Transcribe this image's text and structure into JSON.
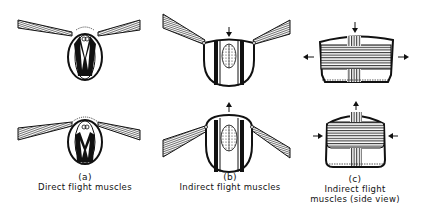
{
  "panels": [
    {
      "id": "a",
      "letter": "(a)",
      "caption": "Direct flight muscles"
    },
    {
      "id": "b",
      "letter": "(b)",
      "caption": "Indirect flight muscles"
    },
    {
      "id": "c",
      "letter": "(c)",
      "caption_line1": "Indirect flight",
      "caption_line2": "muscles (side view)"
    }
  ],
  "colors": {
    "ink": "#111111",
    "background": "#ffffff"
  }
}
